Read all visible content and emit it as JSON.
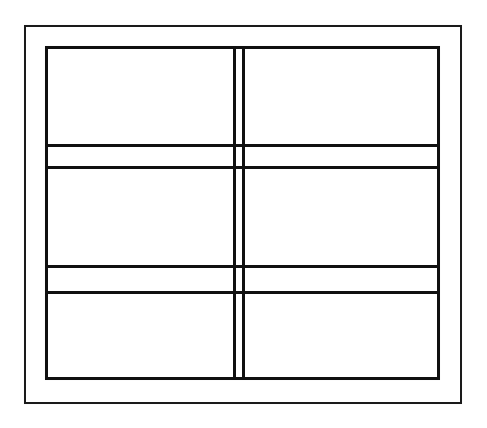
{
  "figure": {
    "kind": "line-drawing",
    "background_color": "#ffffff",
    "ink_color": "#101010",
    "canvas": {
      "width": 487,
      "height": 428
    }
  },
  "outer_border": {
    "name": "outer-border",
    "x": 24,
    "y": 25,
    "width": 438,
    "height": 379,
    "stroke_width": 2,
    "color": "#1a1a1a"
  },
  "inner_frame": {
    "name": "inner-frame",
    "x": 45,
    "y": 46,
    "width": 395,
    "height": 334,
    "stroke_width": 3,
    "color": "#101010"
  },
  "mullions": {
    "vertical": [
      {
        "name": "mullion-left-stile",
        "x": 233,
        "y": 46,
        "height": 334,
        "stroke_width": 3
      },
      {
        "name": "mullion-right-stile",
        "x": 242,
        "y": 46,
        "height": 334,
        "stroke_width": 3
      }
    ],
    "horizontal": [
      {
        "name": "upper-rail-top",
        "x": 45,
        "y": 144,
        "width": 395,
        "stroke_width": 3
      },
      {
        "name": "upper-rail-bottom",
        "x": 45,
        "y": 166,
        "width": 395,
        "stroke_width": 3
      },
      {
        "name": "lower-rail-top",
        "x": 45,
        "y": 265,
        "width": 395,
        "stroke_width": 3
      },
      {
        "name": "lower-rail-bottom",
        "x": 45,
        "y": 291,
        "width": 395,
        "stroke_width": 3
      }
    ]
  },
  "panes": [
    {
      "name": "pane-top-left",
      "row": "top",
      "column": "left",
      "x": 48,
      "y": 49,
      "width": 185,
      "height": 95
    },
    {
      "name": "pane-top-right",
      "row": "top",
      "column": "right",
      "x": 245,
      "y": 49,
      "width": 195,
      "height": 95
    },
    {
      "name": "pane-middle-left",
      "row": "middle",
      "column": "left",
      "x": 48,
      "y": 169,
      "width": 185,
      "height": 96
    },
    {
      "name": "pane-middle-right",
      "row": "middle",
      "column": "right",
      "x": 245,
      "y": 169,
      "width": 195,
      "height": 96
    },
    {
      "name": "pane-bottom-left",
      "row": "bottom",
      "column": "left",
      "x": 48,
      "y": 294,
      "width": 185,
      "height": 86
    },
    {
      "name": "pane-bottom-right",
      "row": "bottom",
      "column": "right",
      "x": 245,
      "y": 294,
      "width": 195,
      "height": 86
    }
  ],
  "rail_strips": [
    {
      "name": "rail-strip-upper-left",
      "x": 48,
      "y": 147,
      "width": 185,
      "height": 19
    },
    {
      "name": "rail-strip-upper-right",
      "x": 245,
      "y": 147,
      "width": 195,
      "height": 19
    },
    {
      "name": "rail-strip-lower-left",
      "x": 48,
      "y": 268,
      "width": 185,
      "height": 23
    },
    {
      "name": "rail-strip-lower-right",
      "x": 245,
      "y": 268,
      "width": 195,
      "height": 23
    }
  ],
  "counts": {
    "panes": 6,
    "vertical_mullion_lines": 2,
    "horizontal_rail_lines": 4,
    "rectangles": 2
  }
}
